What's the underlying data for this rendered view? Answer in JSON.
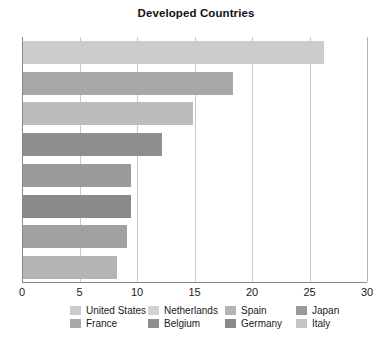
{
  "chart_data": {
    "type": "bar",
    "orientation": "horizontal",
    "title": "Developed Countries",
    "xlabel": "",
    "ylabel": "",
    "xlim": [
      0,
      30
    ],
    "xticks": [
      "0",
      "5",
      "10",
      "15",
      "20",
      "25",
      "30"
    ],
    "grid": true,
    "legend_position": "bottom",
    "categories": [
      "United States",
      "Netherlands",
      "Spain",
      "Japan",
      "France",
      "Belgium",
      "Germany",
      "Italy"
    ],
    "values": [
      26.2,
      18.3,
      14.8,
      12.1,
      9.4,
      9.4,
      9.0,
      8.2
    ],
    "colors": [
      "#cccccc",
      "#a8a8a8",
      "#bcbcbc",
      "#8e8e8e",
      "#9a9a9a",
      "#8a8a8a",
      "#a0a0a0",
      "#b4b4b4"
    ],
    "series": [
      {
        "name": "Developed Countries",
        "points": [
          {
            "label": "United States",
            "value": 26.2,
            "color": "#cccccc"
          },
          {
            "label": "Netherlands",
            "value": 18.3,
            "color": "#a8a8a8"
          },
          {
            "label": "Spain",
            "value": 14.8,
            "color": "#bcbcbc"
          },
          {
            "label": "Japan",
            "value": 12.1,
            "color": "#8e8e8e"
          },
          {
            "label": "France",
            "value": 9.4,
            "color": "#9a9a9a"
          },
          {
            "label": "Belgium",
            "value": 9.4,
            "color": "#8a8a8a"
          },
          {
            "label": "Germany",
            "value": 9.0,
            "color": "#a0a0a0"
          },
          {
            "label": "Italy",
            "value": 8.2,
            "color": "#b4b4b4"
          }
        ]
      }
    ]
  },
  "legend": {
    "rows": [
      [
        {
          "label": "United States",
          "color": "#cccccc"
        },
        {
          "label": "Netherlands",
          "color": "#d2d2d2"
        },
        {
          "label": "Spain",
          "color": "#b4b4b4"
        },
        {
          "label": "Japan",
          "color": "#9a9a9a"
        }
      ],
      [
        {
          "label": "France",
          "color": "#a8a8a8"
        },
        {
          "label": "Belgium",
          "color": "#8e8e8e"
        },
        {
          "label": "Germany",
          "color": "#8a8a8a"
        },
        {
          "label": "Italy",
          "color": "#c4c4c4"
        }
      ]
    ]
  },
  "axis": {
    "line_color": "#8a8a8a",
    "grid_color": "#c9c9c9"
  }
}
